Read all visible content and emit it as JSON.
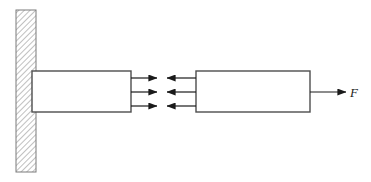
{
  "figure": {
    "width": 371,
    "height": 182,
    "background_color": "#ffffff",
    "stroke_color": "#4d4d4d",
    "fill_color": "#ffffff",
    "hatch_color": "#808080",
    "arrow_color": "#1a1a1a"
  },
  "wall": {
    "name": "fixed-wall",
    "x": 16,
    "y": 10,
    "width": 20,
    "height": 162,
    "hatch_angle_deg": 45,
    "hatch_spacing": 4
  },
  "blocks": [
    {
      "name": "left-block",
      "label": "",
      "x": 32,
      "y": 71,
      "width": 99,
      "height": 41
    },
    {
      "name": "right-block",
      "label": "",
      "x": 196,
      "y": 71,
      "width": 114,
      "height": 41
    }
  ],
  "contact_arrows": {
    "count": 3,
    "rows_y": [
      78,
      92,
      106
    ],
    "right_pointing": {
      "name": "reaction-arrows-right",
      "tail_x": 131,
      "tip_x": 158,
      "direction": "right"
    },
    "left_pointing": {
      "name": "action-arrows-left",
      "tail_x": 196,
      "tip_x": 166,
      "direction": "left"
    }
  },
  "applied_force": {
    "name": "applied-force-F",
    "label": "F",
    "tail_x": 310,
    "tip_x": 347,
    "y": 92,
    "direction": "right",
    "label_x": 354,
    "label_y": 96
  }
}
